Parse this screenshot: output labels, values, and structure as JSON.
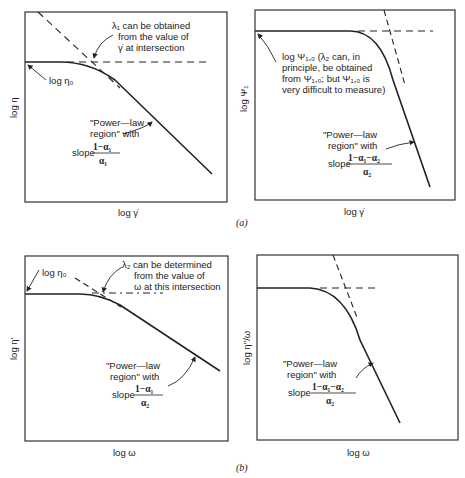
{
  "figure": {
    "captions": {
      "a": "(a)",
      "b": "(b)"
    }
  },
  "panels": [
    {
      "id": "a-left",
      "xlabel": "log γ̇",
      "ylabel": "log η",
      "annotations": {
        "plateau": "log η₀",
        "intersect_line1": "λ₁ can be obtained",
        "intersect_line2": "from the value of",
        "intersect_line3": "γ̇ at intersection",
        "power_line1": "\"Power—law",
        "power_line2": "region\" with",
        "slope_word": "slope",
        "slope_num": "1−α₁",
        "slope_den": "α₁"
      }
    },
    {
      "id": "a-right",
      "xlabel": "log γ̇",
      "ylabel": "log Ψ₁",
      "annotations": {
        "plateau_line1": "log Ψ₁,₀ (λ₂ can, in",
        "plateau_line2": "principle, be obtained",
        "plateau_line3": "from Ψ₁,₀; but Ψ₁,₀ is",
        "plateau_line4": "very difficult to measure)",
        "power_line1": "\"Power—law",
        "power_line2": "region\" with",
        "slope_word": "slope",
        "slope_num": "1−α₁−α₂",
        "slope_den": "α₂"
      }
    },
    {
      "id": "b-left",
      "xlabel": "log ω",
      "ylabel": "log η'",
      "annotations": {
        "plateau": "log η₀",
        "intersect_line1": "λ₂ can be determined",
        "intersect_line2": "from the value of",
        "intersect_line3": "ω at this intersection",
        "power_line1": "\"Power—law",
        "power_line2": "region\" with",
        "slope_word": "slope",
        "slope_num": "1−α₁",
        "slope_den": "α₂"
      }
    },
    {
      "id": "b-right",
      "xlabel": "log ω",
      "ylabel": "log η''/ω",
      "annotations": {
        "power_line1": "\"Power—law",
        "power_line2": "region\" with",
        "slope_word": "slope",
        "slope_num": "1−α₁−α₂",
        "slope_den": "α₂"
      }
    }
  ]
}
